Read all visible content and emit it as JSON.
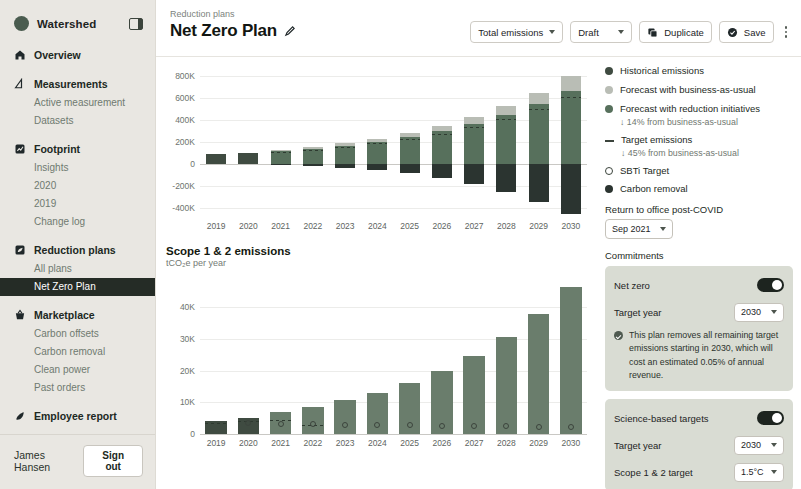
{
  "sidebar": {
    "brand": "Watershed",
    "collapse_icon": "panel-collapse-icon",
    "groups": [
      {
        "icon": "home-icon",
        "label": "Overview",
        "children": []
      },
      {
        "icon": "ruler-icon",
        "label": "Measurements",
        "children": [
          "Active measurement",
          "Datasets"
        ]
      },
      {
        "icon": "chart-icon",
        "label": "Footprint",
        "children": [
          "Insights",
          "2020",
          "2019",
          "Change log"
        ]
      },
      {
        "icon": "leaf-plan-icon",
        "label": "Reduction plans",
        "children": [
          "All plans",
          "Net Zero Plan"
        ]
      },
      {
        "icon": "basket-icon",
        "label": "Marketplace",
        "children": [
          "Carbon offsets",
          "Carbon removal",
          "Clean power",
          "Past orders"
        ]
      },
      {
        "icon": "leaf-icon",
        "label": "Employee report",
        "children": []
      }
    ],
    "active_child": "Net Zero Plan",
    "user": "James Hansen",
    "signout": "Sign out"
  },
  "header": {
    "breadcrumb": "Reduction plans",
    "title": "Net Zero Plan",
    "edit_icon": "pencil-icon",
    "metric_select": "Total emissions",
    "status_select": "Draft",
    "duplicate": "Duplicate",
    "duplicate_icon": "copy-icon",
    "save": "Save",
    "save_icon": "check-circle-icon",
    "more_icon": "kebab-icon"
  },
  "legend": {
    "items": [
      {
        "marker": "dot",
        "color": "#3f4b41",
        "label": "Historical emissions",
        "note": ""
      },
      {
        "marker": "dot",
        "color": "#b9bdb5",
        "label": "Forecast with business-as-usual",
        "note": ""
      },
      {
        "marker": "dot",
        "color": "#57705c",
        "label": "Forecast with reduction initiatives",
        "note": "↓ 14% from business-as-usual"
      },
      {
        "marker": "dash",
        "color": "#3b443c",
        "label": "Target emissions",
        "note": "↓ 45% from business-as-usual"
      },
      {
        "marker": "hollow",
        "color": "#3b443c",
        "label": "SBTi Target",
        "note": ""
      },
      {
        "marker": "dot",
        "color": "#2b3430",
        "label": "Carbon removal",
        "note": ""
      }
    ],
    "return_label": "Return to office post-COVID",
    "return_value": "Sep 2021",
    "commitments_label": "Commitments"
  },
  "commitments": {
    "net_zero": {
      "title": "Net zero",
      "toggle_on": true,
      "target_year_label": "Target year",
      "target_year_value": "2030",
      "note": "This plan removes all remaining target emissions starting in 2030, which will cost an estimated 0.05% of annual revenue."
    },
    "sbt": {
      "title": "Science-based targets",
      "toggle_on": true,
      "target_year_label": "Target year",
      "target_year_value": "2030",
      "scope_label": "Scope 1 & 2 target",
      "scope_value": "1.5°C"
    }
  },
  "chart_data": [
    {
      "type": "bar",
      "name": "total-emissions-chart",
      "title": "",
      "xlabel": "",
      "ylabel": "",
      "categories": [
        "2019",
        "2020",
        "2021",
        "2022",
        "2023",
        "2024",
        "2025",
        "2026",
        "2027",
        "2028",
        "2029",
        "2030"
      ],
      "yticks": [
        "800K",
        "600K",
        "400K",
        "200K",
        "0",
        "-200K",
        "-400K"
      ],
      "ytick_values": [
        800000,
        600000,
        400000,
        200000,
        0,
        -200000,
        -400000
      ],
      "ylim": [
        -480000,
        900000
      ],
      "grid": true,
      "series": [
        {
          "name": "Historical emissions",
          "values": [
            95000,
            100000,
            null,
            null,
            null,
            null,
            null,
            null,
            null,
            null,
            null,
            null
          ]
        },
        {
          "name": "Forecast with reduction initiatives",
          "values": [
            null,
            null,
            118000,
            140000,
            165000,
            200000,
            245000,
            300000,
            365000,
            445000,
            545000,
            665000
          ]
        },
        {
          "name": "Forecast with business-as-usual",
          "values": [
            null,
            null,
            130000,
            158000,
            190000,
            232000,
            285000,
            350000,
            428000,
            525000,
            645000,
            800000
          ]
        },
        {
          "name": "Target emissions",
          "values": [
            null,
            null,
            112000,
            132000,
            156000,
            188000,
            228000,
            278000,
            338000,
            412000,
            500000,
            605000
          ]
        },
        {
          "name": "Carbon removal",
          "values": [
            null,
            null,
            -8000,
            -20000,
            -35000,
            -55000,
            -85000,
            -125000,
            -180000,
            -250000,
            -340000,
            -455000
          ]
        }
      ]
    },
    {
      "type": "bar",
      "name": "scope-1-2-chart",
      "title": "Scope 1 & 2 emissions",
      "subtitle": "tCO₂e per year",
      "xlabel": "",
      "ylabel": "",
      "categories": [
        "2019",
        "2020",
        "2021",
        "2022",
        "2023",
        "2024",
        "2025",
        "2026",
        "2027",
        "2028",
        "2029",
        "2030"
      ],
      "yticks": [
        "40K",
        "30K",
        "20K",
        "10K",
        "0"
      ],
      "ytick_values": [
        40000,
        30000,
        20000,
        10000,
        0
      ],
      "ylim": [
        0,
        48000
      ],
      "grid": true,
      "series": [
        {
          "name": "Emissions",
          "values": [
            4200,
            5200,
            7000,
            8600,
            10600,
            13000,
            16200,
            20000,
            24600,
            30600,
            38000,
            46500
          ]
        },
        {
          "name": "Target emissions",
          "values": [
            3400,
            4200,
            4400,
            3000,
            null,
            null,
            null,
            null,
            null,
            null,
            null,
            null
          ]
        }
      ],
      "sbti_points": [
        null,
        4400,
        4200,
        4000,
        3900,
        3800,
        3700,
        3600,
        3500,
        3400,
        3300,
        3200
      ]
    }
  ]
}
